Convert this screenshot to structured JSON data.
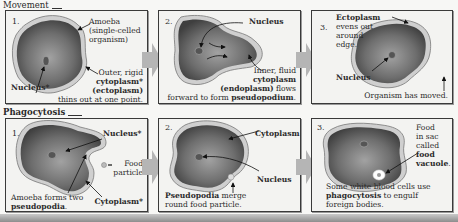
{
  "sections": {
    "movement": {
      "title": "Movement",
      "panels": [
        {
          "number": "1.",
          "labels": {
            "amoeba_1": "Amoeba",
            "amoeba_2": "(single-celled",
            "amoeba_3": "organism)",
            "outer_1": "Outer, rigid",
            "outer_2": "cytoplasm*",
            "outer_3": "(ectoplasm)",
            "outer_4": "thins out at one point.",
            "nucleus": "Nucleus*"
          }
        },
        {
          "number": "2.",
          "labels": {
            "nucleus": "Nucleus",
            "inner_1": "Inner, fluid",
            "inner_2": "cytoplasm",
            "inner_3a": "(endoplasm)",
            "inner_3b": " flows",
            "inner_4a": "forward to form ",
            "inner_4b": "pseudopodium",
            "inner_4c": "."
          }
        },
        {
          "number": "3.",
          "labels": {
            "ecto_1": "Ectoplasm",
            "ecto_2": "evens out",
            "ecto_3": "around",
            "ecto_4": "edge.",
            "nucleus": "Nucleus",
            "moved": "Organism has moved."
          }
        }
      ]
    },
    "phagocytosis": {
      "title": "Phagocytosis",
      "panels": [
        {
          "number": "1.",
          "labels": {
            "nucleus": "Nucleus*",
            "food_1": "Food",
            "food_2": "particle",
            "forms_1": "Amoeba forms two",
            "forms_2": "pseudopodia",
            "forms_3": ".",
            "cytoplasm": "Cytoplasm*"
          }
        },
        {
          "number": "2.",
          "labels": {
            "cytoplasm": "Cytoplasm",
            "nucleus": "Nucleus",
            "merge_1a": "Pseudopodia",
            "merge_1b": " merge",
            "merge_2": "round food particle."
          }
        },
        {
          "number": "3.",
          "labels": {
            "sac_1": "Food",
            "sac_2": "in sac",
            "sac_3": "called",
            "sac_4": "food",
            "sac_5": "vacuole",
            "sac_6": ".",
            "wbc_1": "Some white blood cells use",
            "wbc_2a": "phagocytosis",
            "wbc_2b": " to engulf",
            "wbc_3": "foreign bodies."
          }
        }
      ]
    }
  },
  "colors": {
    "cell_dark": "#4a4a4a",
    "cell_light": "#9a9a9a",
    "membrane": "#c8c8c8",
    "arrow": "#b5b5b5",
    "panel_bg": "#f3f3f1"
  }
}
